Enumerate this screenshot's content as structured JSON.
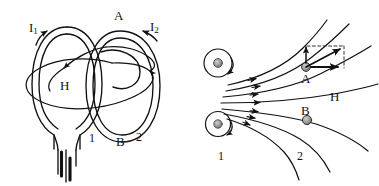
{
  "figure": {
    "name": "magnetic-field-of-two-coils",
    "background_color": "#ffffff",
    "ink_color": "#111111",
    "width": 379,
    "height": 186
  },
  "left_panel": {
    "name": "two-coil-perspective-view",
    "labels": {
      "current_1": "I",
      "current_1_sub": "1",
      "current_2": "I",
      "current_2_sub": "2",
      "field": "H",
      "coil_top": "A",
      "coil_bottom": "B",
      "coil_1_number": "1",
      "coil_2_number": "2"
    },
    "elements": {
      "coil_1": "front oval loop with lead wires",
      "coil_2": "rear oval loop",
      "field_line": "large ellipse threading both coils",
      "terminals": "two parallel lead wires with thick ends"
    }
  },
  "right_panel": {
    "name": "field-line-cross-section-view",
    "labels": {
      "field": "H",
      "point_a": "A",
      "point_b": "B",
      "wire_1_number": "1",
      "wire_2_number": "2"
    },
    "elements": {
      "wire_upper": "circular conductor cross-section with circulating current arrow",
      "wire_lower": "circular conductor cross-section with circulating current arrow",
      "field_lines": "seven curved field lines with directional arrowheads",
      "vector_parallelogram": "dashed rectangle with vertical, horizontal and resultant vectors at point A"
    }
  }
}
